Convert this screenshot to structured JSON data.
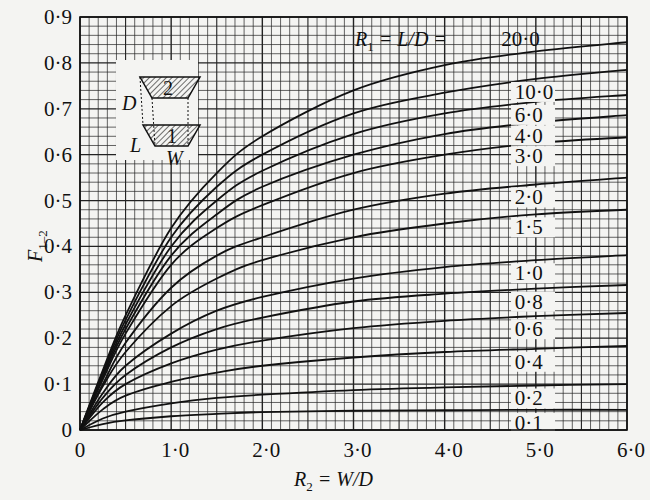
{
  "chart_data": {
    "type": "line",
    "title": "",
    "xlabel": "R2 = W/D",
    "ylabel": "F1-2",
    "xlim": [
      0,
      6.0
    ],
    "ylim": [
      0,
      0.9
    ],
    "grid": true,
    "x_ticks": [
      "0",
      "1·0",
      "2·0",
      "3·0",
      "4·0",
      "5·0",
      "6·0"
    ],
    "y_ticks": [
      "0",
      "0·1",
      "0·2",
      "0·3",
      "0·4",
      "0·5",
      "0·6",
      "0·7",
      "0·8",
      "0·9"
    ],
    "legend_title": "R1 = L/D = ",
    "x": [
      0,
      0.25,
      0.5,
      1.0,
      1.5,
      2.0,
      3.0,
      4.0,
      5.0,
      6.0
    ],
    "series": [
      {
        "name": "20·0",
        "label": "20·0",
        "values": [
          0,
          0.13,
          0.25,
          0.44,
          0.56,
          0.64,
          0.74,
          0.795,
          0.825,
          0.845
        ]
      },
      {
        "name": "10·0",
        "label": "10·0",
        "values": [
          0,
          0.125,
          0.24,
          0.42,
          0.53,
          0.6,
          0.69,
          0.735,
          0.765,
          0.785
        ]
      },
      {
        "name": "6·0",
        "label": "6·0",
        "values": [
          0,
          0.12,
          0.23,
          0.4,
          0.5,
          0.565,
          0.645,
          0.69,
          0.715,
          0.73
        ]
      },
      {
        "name": "4·0",
        "label": "4·0",
        "values": [
          0,
          0.115,
          0.22,
          0.38,
          0.47,
          0.53,
          0.6,
          0.645,
          0.67,
          0.686
        ]
      },
      {
        "name": "3·0",
        "label": "3·0",
        "values": [
          0,
          0.11,
          0.21,
          0.36,
          0.44,
          0.49,
          0.56,
          0.6,
          0.625,
          0.638
        ]
      },
      {
        "name": "2·0",
        "label": "2·0",
        "values": [
          0,
          0.1,
          0.19,
          0.31,
          0.38,
          0.42,
          0.48,
          0.515,
          0.535,
          0.55
        ]
      },
      {
        "name": "1·5",
        "label": "1·5",
        "values": [
          0,
          0.095,
          0.17,
          0.27,
          0.33,
          0.37,
          0.42,
          0.45,
          0.47,
          0.48
        ]
      },
      {
        "name": "1·0",
        "label": "1·0",
        "values": [
          0,
          0.08,
          0.14,
          0.21,
          0.26,
          0.29,
          0.33,
          0.355,
          0.37,
          0.381
        ]
      },
      {
        "name": "0·8",
        "label": "0·8",
        "values": [
          0,
          0.07,
          0.12,
          0.18,
          0.22,
          0.245,
          0.28,
          0.297,
          0.308,
          0.316
        ]
      },
      {
        "name": "0·6",
        "label": "0·6",
        "values": [
          0,
          0.06,
          0.1,
          0.145,
          0.175,
          0.195,
          0.222,
          0.238,
          0.248,
          0.255
        ]
      },
      {
        "name": "0·4",
        "label": "0·4",
        "values": [
          0,
          0.045,
          0.075,
          0.105,
          0.125,
          0.14,
          0.158,
          0.17,
          0.177,
          0.183
        ]
      },
      {
        "name": "0·2",
        "label": "0·2",
        "values": [
          0,
          0.025,
          0.04,
          0.058,
          0.07,
          0.077,
          0.087,
          0.093,
          0.097,
          0.1
        ]
      },
      {
        "name": "0·1",
        "label": "0·1",
        "values": [
          0,
          0.013,
          0.021,
          0.03,
          0.035,
          0.039,
          0.042,
          0.043,
          0.044,
          0.044
        ]
      }
    ],
    "inset_diagram": {
      "labels": {
        "top_surface": "2",
        "bottom_surface": "1",
        "height": "D",
        "length": "L",
        "width": "W"
      }
    }
  },
  "axes": {
    "x_label_main": "R",
    "x_label_sub": "2",
    "x_label_rest": " = W/D",
    "y_label_main": "F",
    "y_label_sub": "1–2",
    "legend_main": "R",
    "legend_sub": "1",
    "legend_rest": " = L/D = "
  },
  "colors": {
    "ink": "#111111",
    "paper": "#f4f4f2",
    "grid": "#222222"
  }
}
